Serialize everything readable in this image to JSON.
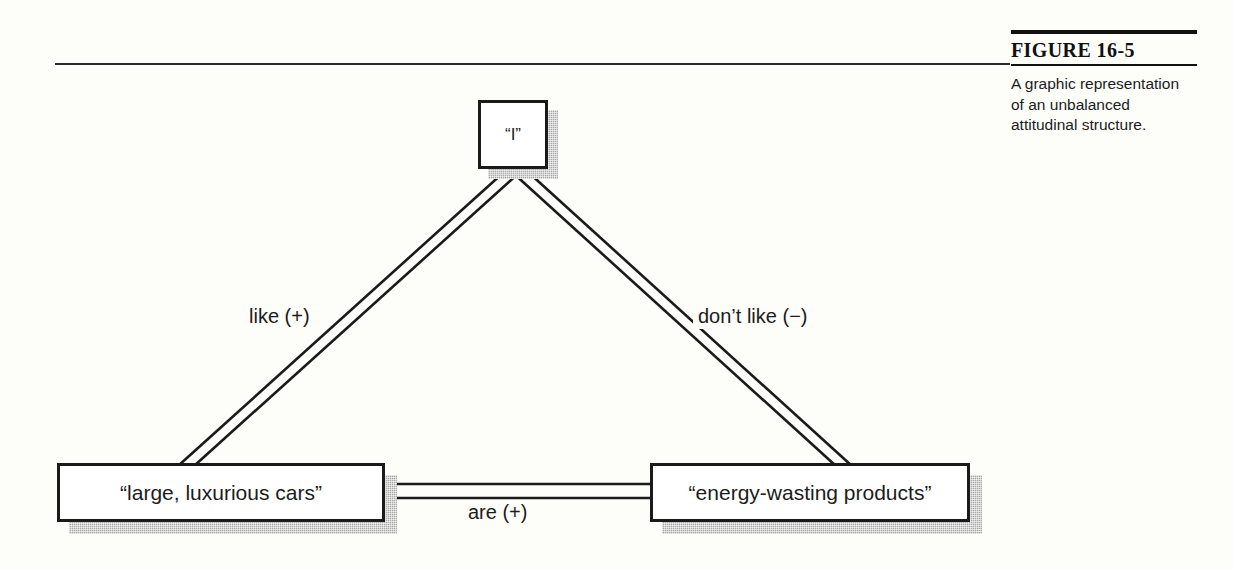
{
  "figure": {
    "number_label": "FIGURE 16-5",
    "caption": "A graphic representation of an unbalanced attitudinal structure."
  },
  "diagram": {
    "type": "balance-theory-triad",
    "nodes": [
      {
        "id": "self",
        "label": "“I”",
        "position": "apex"
      },
      {
        "id": "cars",
        "label": "“large, luxurious cars”",
        "position": "bottom-left"
      },
      {
        "id": "products",
        "label": "“energy-wasting products”",
        "position": "bottom-right"
      }
    ],
    "edges": [
      {
        "id": "edge-like",
        "label": "like (+)",
        "from": "self",
        "to": "cars",
        "sign": "+"
      },
      {
        "id": "edge-dont-like",
        "label": "don’t like (−)",
        "from": "self",
        "to": "products",
        "sign": "−"
      },
      {
        "id": "edge-are",
        "label": "are (+)",
        "from": "cars",
        "to": "products",
        "sign": "+"
      }
    ]
  },
  "colors": {
    "page_background": "#fdfdfa",
    "ink": "#1a1a1a",
    "box_fill": "#ffffff",
    "shadow": "#a8a8a8"
  }
}
